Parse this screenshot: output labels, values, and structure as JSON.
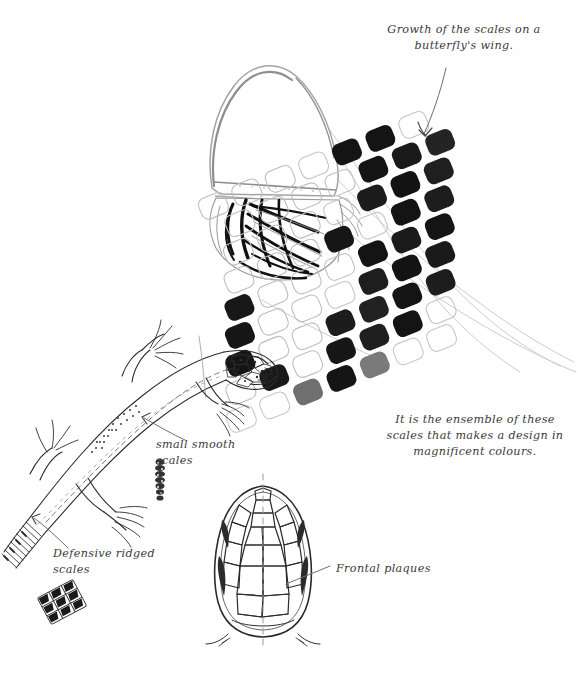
{
  "page": {
    "title": "Growth of the scales on a butterfly's wing",
    "background_color": "#ffffff",
    "ink_color": "#2b2b2b",
    "pencil_color": "#b9b9b9",
    "width": 578,
    "height": 685
  },
  "annotations": {
    "butterfly_title": "Growth of the scales on a\nbutterfly's wing.",
    "butterfly_caption": "It is the ensemble of these\nscales that makes a design in\nmagnificent colours.",
    "small_smooth_scales": "small smooth\nscales",
    "defensive_ridged_scales": "Defensive ridged\nscales",
    "frontal_plaques": "Frontal plaques"
  },
  "figures": {
    "butterfly_wing": {
      "label": "butterfly-wing-drawing",
      "description": "pale outlined teardrop wing with bold black radiating stripes at base"
    },
    "scale_grid": {
      "label": "butterfly-scale-grid",
      "description": "rotated lattice of rounded rectangular wing scales, black filled and white outlined",
      "rotation_degrees": -22,
      "rows": 9,
      "cols": 7,
      "fill_map": [
        [
          0,
          0,
          0,
          0,
          1,
          1,
          0
        ],
        [
          0,
          0,
          0,
          0,
          1,
          1,
          1
        ],
        [
          0,
          0,
          0,
          0,
          1,
          1,
          1
        ],
        [
          0,
          0,
          0,
          1,
          0,
          1,
          1
        ],
        [
          1,
          0,
          0,
          0,
          1,
          1,
          1
        ],
        [
          1,
          0,
          0,
          0,
          1,
          1,
          1
        ],
        [
          1,
          0,
          0,
          1,
          1,
          1,
          1
        ],
        [
          0,
          1,
          0,
          1,
          1,
          1,
          0
        ],
        [
          0,
          0,
          1,
          1,
          2,
          0,
          0
        ]
      ],
      "fill_legend": {
        "0": "outline",
        "1": "black",
        "2": "grey"
      }
    },
    "lizard": {
      "label": "lizard-body-drawing",
      "description": "pen line lizard, curved body, reticulated head, four splayed-toe legs, banded tail"
    },
    "lizard_head": {
      "label": "lizard-head-dorsal-drawing",
      "description": "dorsal view of lizard head showing symmetric polygonal frontal plates with dashed midline"
    },
    "smooth_scale_sample": {
      "label": "smooth-scale-sample",
      "description": "small stippled vertical strip of fine smooth scales"
    },
    "ridged_scale_sample": {
      "label": "ridged-scale-sample",
      "description": "small patch of keeled ridged scales in a rotated grid"
    }
  }
}
